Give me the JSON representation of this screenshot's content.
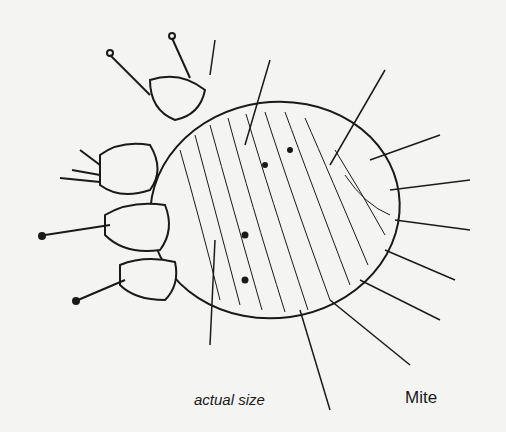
{
  "figure": {
    "caption_size": "actual size",
    "caption_name": "Mite"
  },
  "colors": {
    "background": "#f4f4f2",
    "ink": "#1a1a1a"
  }
}
